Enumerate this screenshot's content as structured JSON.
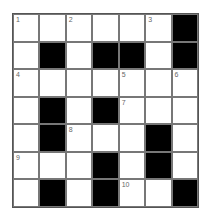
{
  "puzzle": {
    "rows": 7,
    "cols": 7,
    "colors": {
      "black": "#000000",
      "white": "#ffffff",
      "line": "#777777"
    },
    "cells": [
      [
        {
          "n": "1"
        },
        {},
        {
          "n": "2"
        },
        {},
        {},
        {
          "n": "3"
        },
        {
          "b": true
        }
      ],
      [
        {},
        {
          "b": true
        },
        {},
        {
          "b": true
        },
        {
          "b": true
        },
        {},
        {
          "b": true
        }
      ],
      [
        {
          "n": "4"
        },
        {},
        {},
        {},
        {
          "n": "5"
        },
        {},
        {
          "n": "6"
        }
      ],
      [
        {},
        {
          "b": true
        },
        {},
        {
          "b": true
        },
        {
          "n": "7"
        },
        {},
        {}
      ],
      [
        {},
        {
          "b": true
        },
        {
          "n": "8"
        },
        {},
        {},
        {
          "b": true
        },
        {}
      ],
      [
        {
          "n": "9"
        },
        {},
        {},
        {
          "b": true
        },
        {},
        {
          "b": true
        },
        {}
      ],
      [
        {},
        {
          "b": true
        },
        {},
        {
          "b": true
        },
        {
          "n": "10"
        },
        {},
        {
          "b": true
        }
      ]
    ]
  }
}
